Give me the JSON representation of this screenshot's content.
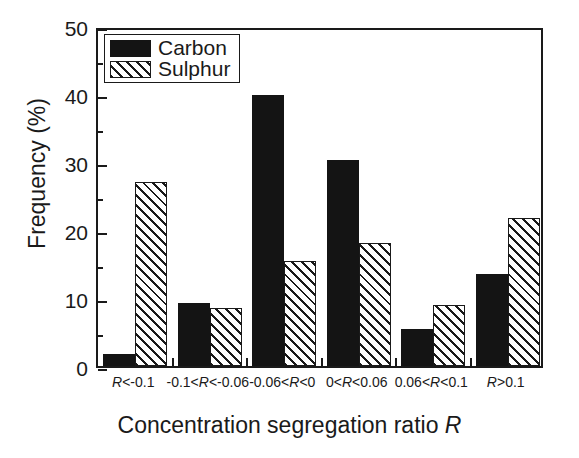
{
  "chart_data": {
    "type": "bar",
    "title": "",
    "xlabel": "Concentration segregation ratio R",
    "xlabel_plain": "Concentration segregation ratio ",
    "xlabel_italic": "R",
    "ylabel": "Frequency (%)",
    "ylim": [
      0,
      50
    ],
    "yticks": [
      0,
      10,
      20,
      30,
      40,
      50
    ],
    "ytick_labels": [
      "0",
      "10",
      "20",
      "30",
      "40",
      "50"
    ],
    "yminor_ticks": [
      5,
      15,
      25,
      35,
      45
    ],
    "grid": false,
    "legend_position": "top-left",
    "categories": [
      "R<-0.1",
      "-0.1<R<-0.06",
      "-0.06<R<0",
      "0<R<0.06",
      "0.06<R<0.1",
      "R>0.1"
    ],
    "series": [
      {
        "name": "Carbon",
        "fill": "solid-black",
        "color": "#141414",
        "values": [
          1.8,
          9.2,
          39.8,
          30.3,
          5.5,
          13.6
        ]
      },
      {
        "name": "Sulphur",
        "fill": "diagonal-hatch",
        "color": "#1a1a1a",
        "values": [
          27.1,
          8.5,
          15.4,
          18.1,
          9.0,
          21.8
        ]
      }
    ]
  },
  "legend": {
    "items": [
      {
        "label": "Carbon"
      },
      {
        "label": "Sulphur"
      }
    ]
  },
  "colors": {
    "axis": "#1a1a1a",
    "background": "#ffffff",
    "carbon": "#141414",
    "sulphur": "#1a1a1a"
  }
}
